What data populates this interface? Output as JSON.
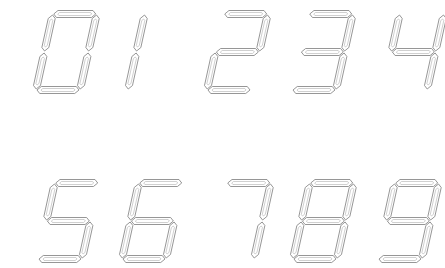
{
  "style": {
    "stroke": "#8a8a8a",
    "inner_stroke": "#b0b0b0",
    "background": "#ffffff"
  },
  "geometry": {
    "digit_width": 44,
    "digit_height": 76,
    "slant": 0.22,
    "segment_thickness": 7
  },
  "digits": [
    {
      "label": "0",
      "x": 36,
      "y": 14,
      "segments": [
        "a",
        "b",
        "c",
        "d",
        "e",
        "f"
      ]
    },
    {
      "label": "1",
      "x": 84,
      "y": 14,
      "segments": [
        "b",
        "c"
      ]
    },
    {
      "label": "2",
      "x": 207,
      "y": 14,
      "segments": [
        "a",
        "b",
        "g",
        "e",
        "d"
      ]
    },
    {
      "label": "3",
      "x": 292,
      "y": 14,
      "segments": [
        "a",
        "b",
        "g",
        "c",
        "d"
      ]
    },
    {
      "label": "4",
      "x": 383,
      "y": 14,
      "segments": [
        "f",
        "g",
        "b",
        "c"
      ]
    },
    {
      "label": "5",
      "x": 38,
      "y": 183,
      "segments": [
        "a",
        "f",
        "g",
        "c",
        "d"
      ]
    },
    {
      "label": "6",
      "x": 122,
      "y": 183,
      "segments": [
        "a",
        "f",
        "g",
        "e",
        "c",
        "d"
      ]
    },
    {
      "label": "7",
      "x": 210,
      "y": 183,
      "segments": [
        "a",
        "b",
        "c"
      ]
    },
    {
      "label": "8",
      "x": 293,
      "y": 183,
      "segments": [
        "a",
        "b",
        "c",
        "d",
        "e",
        "f",
        "g"
      ]
    },
    {
      "label": "9",
      "x": 378,
      "y": 183,
      "segments": [
        "a",
        "b",
        "c",
        "d",
        "f",
        "g"
      ]
    }
  ]
}
